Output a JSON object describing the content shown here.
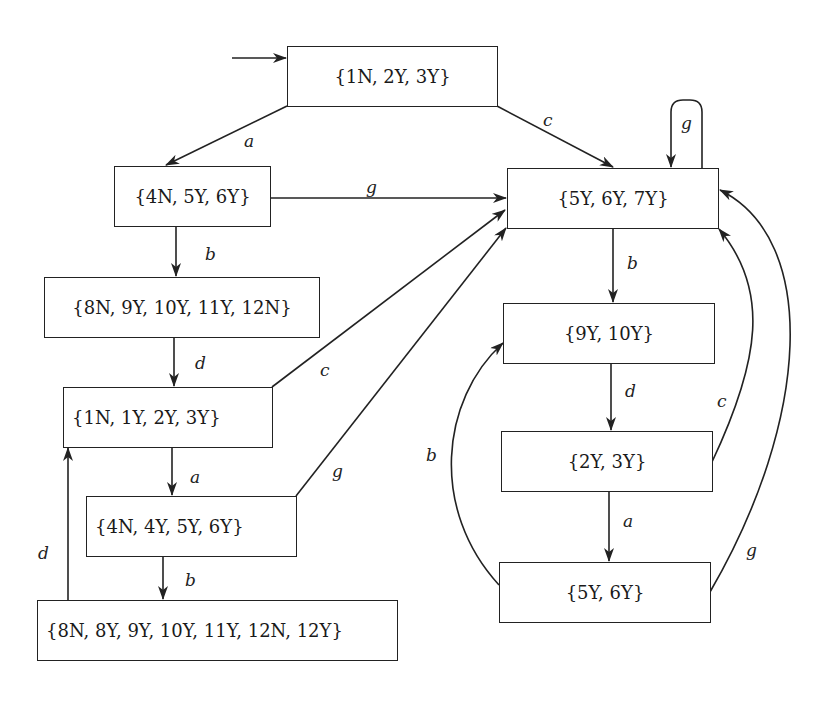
{
  "diagram": {
    "type": "state-transition graph",
    "start_state": "s0",
    "states": {
      "s0": "{1N, 2Y, 3Y}",
      "s1": "{4N, 5Y, 6Y}",
      "s2": "{5Y, 6Y, 7Y}",
      "s3": "{8N, 9Y, 10Y, 11Y, 12N}",
      "s4": "{1N, 1Y, 2Y, 3Y}",
      "s5": "{9Y, 10Y}",
      "s6": "{2Y, 3Y}",
      "s7": "{4N, 4Y, 5Y, 6Y}",
      "s8": "{5Y, 6Y}",
      "s9": "{8N, 8Y, 9Y, 10Y, 11Y, 12N, 12Y}"
    },
    "transitions": [
      {
        "from": "s0",
        "to": "s1",
        "label": "a"
      },
      {
        "from": "s0",
        "to": "s2",
        "label": "c"
      },
      {
        "from": "s2",
        "to": "s2",
        "label": "g"
      },
      {
        "from": "s1",
        "to": "s2",
        "label": "g"
      },
      {
        "from": "s1",
        "to": "s3",
        "label": "b"
      },
      {
        "from": "s3",
        "to": "s4",
        "label": "d"
      },
      {
        "from": "s4",
        "to": "s2",
        "label": "c"
      },
      {
        "from": "s4",
        "to": "s7",
        "label": "a"
      },
      {
        "from": "s7",
        "to": "s2",
        "label": "g"
      },
      {
        "from": "s7",
        "to": "s9",
        "label": "b"
      },
      {
        "from": "s9",
        "to": "s4",
        "label": "d"
      },
      {
        "from": "s2",
        "to": "s5",
        "label": "b"
      },
      {
        "from": "s5",
        "to": "s6",
        "label": "d"
      },
      {
        "from": "s6",
        "to": "s2",
        "label": "c"
      },
      {
        "from": "s6",
        "to": "s8",
        "label": "a"
      },
      {
        "from": "s8",
        "to": "s5",
        "label": "b"
      },
      {
        "from": "s8",
        "to": "s2",
        "label": "g"
      }
    ],
    "edge_labels": {
      "s0_s1": "a",
      "s0_s2": "c",
      "s2_s2": "g",
      "s1_s2": "g",
      "s1_s3": "b",
      "s3_s4": "d",
      "s4_s2": "c",
      "s4_s7": "a",
      "s7_s2": "g",
      "s7_s9": "b",
      "s9_s4": "d",
      "s2_s5": "b",
      "s5_s6": "d",
      "s6_s2": "c",
      "s6_s8": "a",
      "s8_s5": "b",
      "s8_s2": "g"
    },
    "colors": {
      "stroke": "#222222",
      "background": "#ffffff"
    }
  }
}
